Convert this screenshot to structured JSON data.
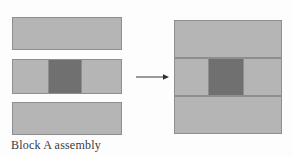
{
  "figure": {
    "caption": "Block A assembly",
    "colors": {
      "background": "#fdfdfd",
      "light_block": "#b5b5b5",
      "dark_block": "#707070",
      "outline": "#8e8e8e",
      "caption_text": "#3a3a3a"
    },
    "exploded_view": {
      "label": "exploded-parts",
      "parts": [
        {
          "name": "top-plate",
          "shade": "light"
        },
        {
          "name": "middle-plate",
          "shade": "light"
        },
        {
          "name": "middle-core",
          "shade": "dark"
        },
        {
          "name": "bottom-plate",
          "shade": "light"
        }
      ]
    },
    "arrow": {
      "name": "assembly-arrow",
      "direction": "right"
    },
    "assembled_view": {
      "label": "assembled-block",
      "parts": [
        {
          "name": "top-plate",
          "shade": "light"
        },
        {
          "name": "middle-plate",
          "shade": "light"
        },
        {
          "name": "middle-core",
          "shade": "dark"
        },
        {
          "name": "bottom-plate",
          "shade": "light"
        }
      ]
    }
  }
}
